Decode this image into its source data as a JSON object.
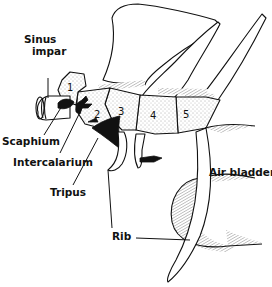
{
  "figure": {
    "labels": {
      "sinus_impar_line1": "Sinus",
      "sinus_impar_line2": "impar",
      "scaphium": "Scaphium",
      "intercalarium": "Intercalarium",
      "tripus": "Tripus",
      "rib": "Rib",
      "air_bladder": "Air bladder"
    },
    "vertebra_numbers": [
      "1",
      "2",
      "3",
      "4",
      "5"
    ],
    "colors": {
      "ink": "#111111",
      "background": "#ffffff"
    }
  }
}
